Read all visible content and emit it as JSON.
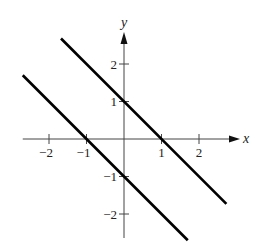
{
  "chart_data": {
    "type": "line",
    "title": "",
    "xlabel": "x",
    "ylabel": "y",
    "xlim": [
      -2.7,
      2.9
    ],
    "ylim": [
      -2.7,
      2.8
    ],
    "grid": false,
    "legend": null,
    "x_ticks": [
      -2,
      -1,
      1,
      2
    ],
    "x_tick_labels": [
      "−2",
      "−1",
      "1",
      "2"
    ],
    "y_ticks": [
      2,
      1,
      -1,
      -2
    ],
    "y_tick_labels": [
      "2",
      "1",
      "−1",
      "−2"
    ],
    "series": [
      {
        "name": "y = -x + 1",
        "equation": "y = -x + 1",
        "x": [
          -1.68,
          2.73
        ],
        "y": [
          2.68,
          -1.73
        ],
        "color": "#000000"
      },
      {
        "name": "y = -x - 1",
        "equation": "y = -x - 1",
        "x": [
          -2.7,
          1.7
        ],
        "y": [
          1.7,
          -2.7
        ],
        "color": "#000000"
      }
    ]
  },
  "layout": {
    "origin_px": [
      124,
      139
    ],
    "unit_px": 37.5
  }
}
